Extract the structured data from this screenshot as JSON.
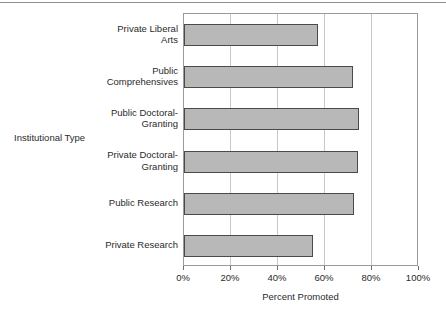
{
  "chart_data": {
    "type": "bar",
    "orientation": "horizontal",
    "title": "",
    "xlabel": "Percent Promoted",
    "ylabel": "Institutional Type",
    "categories": [
      "Private Liberal Arts",
      "Public Comprehensives",
      "Public Doctoral-Granting",
      "Private Doctoral-Granting",
      "Public Research",
      "Private Research"
    ],
    "category_lines": [
      "Private Liberal\nArts",
      "Public\nComprehensives",
      "Public Doctoral-\nGranting",
      "Private Doctoral-\nGranting",
      "Public Research",
      "Private Research"
    ],
    "values": [
      57,
      72,
      74.5,
      74,
      72.5,
      55
    ],
    "xlim": [
      0,
      100
    ],
    "xticks": [
      0,
      20,
      40,
      60,
      80,
      100
    ],
    "xtick_labels": [
      "0%",
      "20%",
      "40%",
      "60%",
      "80%",
      "100%"
    ],
    "grid": true,
    "grid_axis": "x",
    "legend": false,
    "bar_fill_color": "#b8b8b8",
    "bar_border_color": "#4a4a4a",
    "gridline_color": "#c8c8c8",
    "frame_color": "#9a9a9a"
  }
}
